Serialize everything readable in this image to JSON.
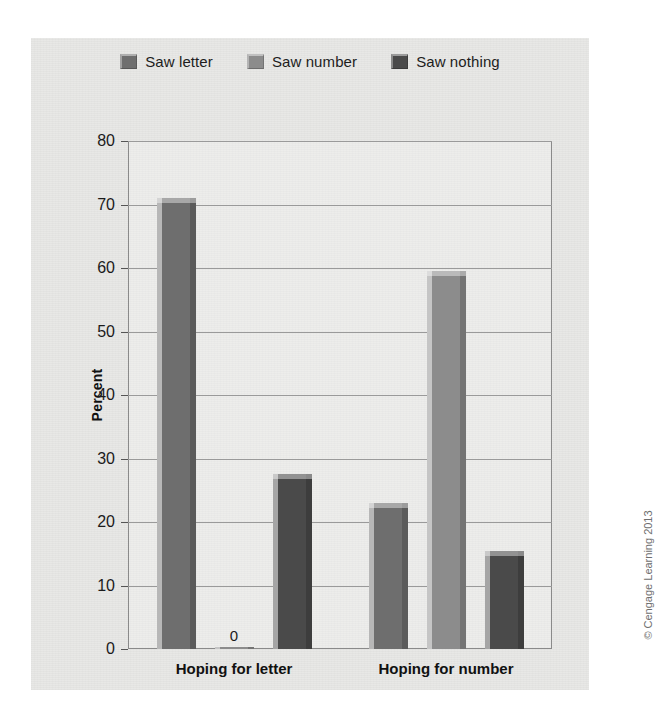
{
  "legend": {
    "items": [
      {
        "label": "Saw letter",
        "color": "#6e6e6e"
      },
      {
        "label": "Saw number",
        "color": "#8c8c8c"
      },
      {
        "label": "Saw nothing",
        "color": "#4a4a4a"
      }
    ]
  },
  "axes": {
    "y_title": "Percent",
    "y_ticks": [
      "80",
      "70",
      "60",
      "50",
      "40",
      "30",
      "20",
      "10",
      "0"
    ]
  },
  "credit": "© Cengage Learning 2013",
  "chart_data": {
    "type": "bar",
    "title": "",
    "xlabel": "",
    "ylabel": "Percent",
    "ylim": [
      0,
      80
    ],
    "ytick_step": 10,
    "grid": true,
    "legend_position": "top-center",
    "categories": [
      "Hoping for letter",
      "Hoping for number"
    ],
    "series": [
      {
        "name": "Saw letter",
        "color": "#6e6e6e",
        "values": [
          71,
          23
        ]
      },
      {
        "name": "Saw number",
        "color": "#8c8c8c",
        "values": [
          0,
          59.5
        ]
      },
      {
        "name": "Saw nothing",
        "color": "#4a4a4a",
        "values": [
          27.5,
          15.5
        ]
      }
    ],
    "data_labels": [
      {
        "category": "Hoping for letter",
        "series": "Saw number",
        "text": "0"
      }
    ]
  }
}
